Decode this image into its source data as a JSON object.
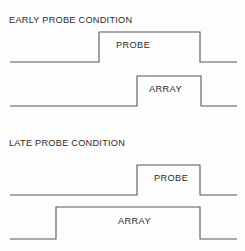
{
  "figure": {
    "background_color": "#fdfdfd",
    "line_color": "#57575c",
    "text_color": "#2b2b2b",
    "width": 245,
    "height": 251
  },
  "sections": [
    {
      "id": "early",
      "title": "EARLY PROBE CONDITION",
      "traces": [
        {
          "id": "early-probe",
          "label": "PROBE"
        },
        {
          "id": "early-array",
          "label": "ARRAY"
        }
      ]
    },
    {
      "id": "late",
      "title": "LATE PROBE CONDITION",
      "traces": [
        {
          "id": "late-probe",
          "label": "PROBE"
        },
        {
          "id": "late-array",
          "label": "ARRAY"
        }
      ]
    }
  ],
  "chart_data": {
    "type": "line",
    "subtitle": "",
    "xlabel": "",
    "ylabel": "",
    "grid": false,
    "legend_position": "none",
    "axis_ranges": {
      "xlim": [
        0,
        245
      ],
      "ylim": [
        0,
        251
      ]
    },
    "series": [
      {
        "name": "EARLY PROBE CONDITION / PROBE",
        "section": "early",
        "label": "PROBE",
        "baseline_y": 62,
        "plateau_y": 32,
        "onset_x": 99,
        "offset_x": 200,
        "trace_start_x": 10,
        "trace_end_x": 237,
        "points": [
          [
            10,
            62
          ],
          [
            99,
            62
          ],
          [
            99,
            32
          ],
          [
            200,
            32
          ],
          [
            200,
            62
          ],
          [
            237,
            62
          ]
        ]
      },
      {
        "name": "EARLY PROBE CONDITION / ARRAY",
        "section": "early",
        "label": "ARRAY",
        "baseline_y": 106,
        "plateau_y": 76,
        "onset_x": 137,
        "offset_x": 201,
        "trace_start_x": 10,
        "trace_end_x": 237,
        "points": [
          [
            10,
            106
          ],
          [
            137,
            106
          ],
          [
            137,
            76
          ],
          [
            201,
            76
          ],
          [
            201,
            106
          ],
          [
            237,
            106
          ]
        ]
      },
      {
        "name": "LATE PROBE CONDITION / PROBE",
        "section": "late",
        "label": "PROBE",
        "baseline_y": 195,
        "plateau_y": 165,
        "onset_x": 137,
        "offset_x": 200,
        "trace_start_x": 10,
        "trace_end_x": 237,
        "points": [
          [
            10,
            195
          ],
          [
            137,
            195
          ],
          [
            137,
            165
          ],
          [
            200,
            165
          ],
          [
            200,
            195
          ],
          [
            237,
            195
          ]
        ]
      },
      {
        "name": "LATE PROBE CONDITION / ARRAY",
        "section": "late",
        "label": "ARRAY",
        "baseline_y": 239,
        "plateau_y": 207,
        "onset_x": 56,
        "offset_x": 200,
        "trace_start_x": 10,
        "trace_end_x": 237,
        "points": [
          [
            10,
            239
          ],
          [
            56,
            239
          ],
          [
            56,
            207
          ],
          [
            200,
            207
          ],
          [
            200,
            239
          ],
          [
            237,
            239
          ]
        ]
      }
    ]
  }
}
